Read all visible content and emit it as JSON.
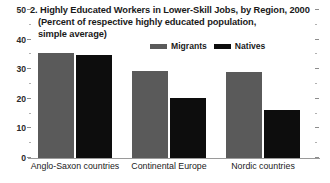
{
  "chart_data": {
    "type": "bar",
    "title": "2. Highly Educated Workers in Lower-Skill Jobs, by Region, 2000",
    "subtitle_line1": "(Percent of respective highly educated population,",
    "subtitle_line2": "simple average)",
    "categories": [
      "Anglo-Saxon countries",
      "Continental Europe",
      "Nordic countries"
    ],
    "series": [
      {
        "name": "Migrants",
        "color": "#5a5a5a",
        "values": [
          35.5,
          29.5,
          29.0
        ]
      },
      {
        "name": "Natives",
        "color": "#0d0d0d",
        "values": [
          34.8,
          20.3,
          16.2
        ]
      }
    ],
    "xlabel": "",
    "ylabel": "",
    "ylim": [
      0,
      50
    ],
    "ytick_labels": [
      "0",
      "10",
      "20",
      "30",
      "40",
      "50"
    ],
    "ytick_values": [
      0,
      10,
      20,
      30,
      40,
      50
    ],
    "minor_tick_values": [
      5,
      15,
      25,
      35,
      45
    ],
    "grid": false,
    "legend_position": "top-right",
    "axis_mirrored_ticks": true
  },
  "colors": {
    "migrants": "#5a5a5a",
    "natives": "#0d0d0d",
    "axis": "#8d8d8d",
    "text": "#1a1a1a",
    "background": "#ffffff"
  }
}
